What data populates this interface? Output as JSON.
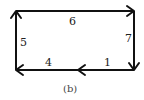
{
  "diagram": {
    "type": "directed-cycle",
    "caption": "(b)",
    "nodes": [
      {
        "id": "top-left"
      },
      {
        "id": "top-right"
      },
      {
        "id": "bottom-right"
      },
      {
        "id": "bottom-mid"
      },
      {
        "id": "bottom-left"
      }
    ],
    "edges": [
      {
        "from": "top-left",
        "to": "top-right",
        "label": "6"
      },
      {
        "from": "top-right",
        "to": "bottom-right",
        "label": "7"
      },
      {
        "from": "bottom-right",
        "to": "bottom-mid",
        "label": "1"
      },
      {
        "from": "bottom-mid",
        "to": "bottom-left",
        "label": "4"
      },
      {
        "from": "bottom-left",
        "to": "top-left",
        "label": "5"
      }
    ],
    "colors": {
      "stroke": "#111111",
      "text": "#222222"
    }
  }
}
